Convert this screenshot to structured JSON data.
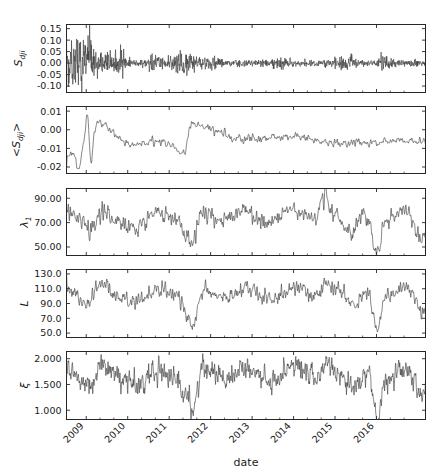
{
  "figure": {
    "width": 443,
    "height": 472,
    "background": "#ffffff",
    "line_color": "#3c3c3c",
    "axis_color": "#262626",
    "xlabel": "date"
  },
  "chart_data": {
    "type": "line",
    "title": "",
    "xlabel": "date",
    "ylabel": "",
    "grid": false,
    "legend": null,
    "layout": "5 stacked panels sharing a common time axis",
    "x_axis": {
      "type": "date",
      "tick_labels": [
        "2009",
        "2010",
        "2011",
        "2012",
        "2013",
        "2014",
        "2015",
        "2016"
      ],
      "tick_rotation_deg": -45,
      "range_start": "2008-07",
      "range_end": "2016-10",
      "minor_ticks_per_major": 2
    },
    "panels": [
      {
        "id": "panel-sdji",
        "ylabel": "S_dji",
        "ylabel_display": "S",
        "ylabel_sub": "dji",
        "ytick_labels": [
          "0.15",
          "0.10",
          "0.05",
          "0.00",
          "-0.05",
          "-0.10"
        ],
        "ytick_values": [
          0.15,
          0.1,
          0.05,
          0.0,
          -0.05,
          -0.1
        ],
        "ylim": [
          -0.128,
          0.168
        ],
        "description": "Daily DJIA index returns. High volatility cluster late 2008 to mid 2009 with spikes to +0.105 and -0.095, smaller bursts at 2010 flash crash, 2011 European debt crisis, and 2015 correction. Baseline noise amplitude about 0.008.",
        "series": [
          {
            "name": "S_dji",
            "seed": 11,
            "baseline": 0.0,
            "base_amp": 0.0075,
            "volatility_events": [
              {
                "x": 0.005,
                "width": 0.085,
                "amp": 0.055
              },
              {
                "x": 0.055,
                "width": 0.05,
                "amp": 0.032
              },
              {
                "x": 0.135,
                "width": 0.045,
                "amp": 0.02
              },
              {
                "x": 0.245,
                "width": 0.035,
                "amp": 0.016
              },
              {
                "x": 0.325,
                "width": 0.045,
                "amp": 0.02
              },
              {
                "x": 0.4,
                "width": 0.03,
                "amp": 0.012
              },
              {
                "x": 0.6,
                "width": 0.03,
                "amp": 0.009
              },
              {
                "x": 0.78,
                "width": 0.035,
                "amp": 0.014
              },
              {
                "x": 0.885,
                "width": 0.025,
                "amp": 0.011
              }
            ],
            "spikes": [
              {
                "x": 0.028,
                "y": 0.105
              },
              {
                "x": 0.033,
                "y": -0.095
              },
              {
                "x": 0.02,
                "y": 0.062
              },
              {
                "x": 0.041,
                "y": -0.078
              },
              {
                "x": 0.062,
                "y": 0.052
              },
              {
                "x": 0.072,
                "y": -0.04
              },
              {
                "x": 0.248,
                "y": 0.035
              },
              {
                "x": 0.335,
                "y": -0.055
              },
              {
                "x": 0.345,
                "y": 0.04
              },
              {
                "x": 0.795,
                "y": 0.038
              }
            ]
          }
        ]
      },
      {
        "id": "panel-mean-sdji",
        "ylabel": "<S_dji>",
        "ylabel_display": "<S",
        "ylabel_sub": "dji",
        "ylabel_tail": ">",
        "ytick_labels": [
          "0.01",
          "0.00",
          "-0.01",
          "-0.02"
        ],
        "ytick_values": [
          0.01,
          0.0,
          -0.01,
          -0.02
        ],
        "ylim": [
          -0.0235,
          0.0125
        ],
        "description": "Windowed mean of DJIA returns. Deep negative excursions to -0.021 in late 2008 / early 2009, recovery after, mild oscillation around zero with dips near -0.009 in 2010, -0.012 in 2011, -0.007 in 2015 and 2016.",
        "series": [
          {
            "name": "<S_dji>",
            "seed": 29,
            "baseline": 0.0005,
            "base_amp": 0.0022,
            "smooth": 3,
            "events": [
              {
                "x": 0.02,
                "y": -0.0135
              },
              {
                "x": 0.035,
                "y": -0.0205
              },
              {
                "x": 0.048,
                "y": -0.0065
              },
              {
                "x": 0.058,
                "y": 0.0098
              },
              {
                "x": 0.068,
                "y": -0.0185
              },
              {
                "x": 0.082,
                "y": 0.0042
              },
              {
                "x": 0.18,
                "y": -0.0075
              },
              {
                "x": 0.255,
                "y": -0.0062
              },
              {
                "x": 0.33,
                "y": -0.0118
              },
              {
                "x": 0.345,
                "y": 0.0035
              },
              {
                "x": 0.5,
                "y": -0.0048
              },
              {
                "x": 0.64,
                "y": -0.004
              },
              {
                "x": 0.76,
                "y": -0.0068
              },
              {
                "x": 0.86,
                "y": -0.0072
              },
              {
                "x": 0.905,
                "y": -0.0062
              }
            ]
          }
        ]
      },
      {
        "id": "panel-lambda1",
        "ylabel": "lambda_1",
        "ylabel_display": "λ",
        "ylabel_sub": "1",
        "ytick_labels": [
          "90.00",
          "70.00",
          "50.00"
        ],
        "ytick_values": [
          90,
          70,
          50
        ],
        "ylim": [
          43,
          98
        ],
        "description": "Largest eigenvalue of the correlation matrix. Oscillates around 72 with range roughly 55 to 92. Sharp drops to about 52 in late 2011 and about 48 in early 2016, peak near 93 in mid 2014.",
        "series": [
          {
            "name": "lambda_1",
            "seed": 47,
            "baseline": 72,
            "base_amp": 6.5,
            "smooth": 2,
            "events": [
              {
                "x": 0.015,
                "y": 78
              },
              {
                "x": 0.06,
                "y": 64
              },
              {
                "x": 0.105,
                "y": 80
              },
              {
                "x": 0.15,
                "y": 70
              },
              {
                "x": 0.19,
                "y": 65
              },
              {
                "x": 0.25,
                "y": 79
              },
              {
                "x": 0.3,
                "y": 74
              },
              {
                "x": 0.34,
                "y": 57
              },
              {
                "x": 0.352,
                "y": 52
              },
              {
                "x": 0.375,
                "y": 78
              },
              {
                "x": 0.43,
                "y": 72
              },
              {
                "x": 0.49,
                "y": 80
              },
              {
                "x": 0.56,
                "y": 70
              },
              {
                "x": 0.63,
                "y": 81
              },
              {
                "x": 0.69,
                "y": 73
              },
              {
                "x": 0.72,
                "y": 92
              },
              {
                "x": 0.745,
                "y": 78
              },
              {
                "x": 0.79,
                "y": 63
              },
              {
                "x": 0.83,
                "y": 76
              },
              {
                "x": 0.868,
                "y": 48
              },
              {
                "x": 0.885,
                "y": 72
              },
              {
                "x": 0.94,
                "y": 80
              },
              {
                "x": 0.985,
                "y": 60
              }
            ]
          }
        ]
      },
      {
        "id": "panel-L",
        "ylabel": "L",
        "ylabel_display": "L",
        "ytick_labels": [
          "130.0",
          "110.0",
          "90.0",
          "70.0",
          "50.0"
        ],
        "ytick_values": [
          130,
          110,
          90,
          70,
          50
        ],
        "ylim": [
          44,
          136
        ],
        "description": "Network measure L. Fluctuates around 100 within 80 to 120. Deep troughs to about 58 in late 2011 and about 55 in early 2016, peaks near 122 in 2009 and 2014.",
        "series": [
          {
            "name": "L",
            "seed": 63,
            "baseline": 100,
            "base_amp": 10,
            "smooth": 2,
            "events": [
              {
                "x": 0.012,
                "y": 104
              },
              {
                "x": 0.055,
                "y": 88
              },
              {
                "x": 0.1,
                "y": 118
              },
              {
                "x": 0.15,
                "y": 98
              },
              {
                "x": 0.2,
                "y": 92
              },
              {
                "x": 0.255,
                "y": 108
              },
              {
                "x": 0.305,
                "y": 100
              },
              {
                "x": 0.34,
                "y": 72
              },
              {
                "x": 0.352,
                "y": 58
              },
              {
                "x": 0.38,
                "y": 108
              },
              {
                "x": 0.44,
                "y": 98
              },
              {
                "x": 0.5,
                "y": 110
              },
              {
                "x": 0.57,
                "y": 96
              },
              {
                "x": 0.64,
                "y": 112
              },
              {
                "x": 0.7,
                "y": 100
              },
              {
                "x": 0.725,
                "y": 120
              },
              {
                "x": 0.76,
                "y": 104
              },
              {
                "x": 0.8,
                "y": 86
              },
              {
                "x": 0.84,
                "y": 104
              },
              {
                "x": 0.868,
                "y": 55
              },
              {
                "x": 0.888,
                "y": 98
              },
              {
                "x": 0.945,
                "y": 112
              },
              {
                "x": 0.99,
                "y": 80
              }
            ]
          }
        ]
      },
      {
        "id": "panel-xi",
        "ylabel": "xi",
        "ylabel_display": "ξ",
        "ytick_labels": [
          "2.000",
          "1.500",
          "1.000"
        ],
        "ytick_values": [
          2.0,
          1.5,
          1.0
        ],
        "ylim": [
          0.82,
          2.14
        ],
        "description": "Correlation length xi. Noisy band centred near 1.6 spanning roughly 1.25 to 2.0. Drops to about 0.95 in late 2011 and about 0.88 in early 2016, highest sustained values near 1.95 during 2013 and 2014.",
        "series": [
          {
            "name": "xi",
            "seed": 81,
            "baseline": 1.62,
            "base_amp": 0.17,
            "smooth": 1,
            "events": [
              {
                "x": 0.015,
                "y": 1.7
              },
              {
                "x": 0.055,
                "y": 1.45
              },
              {
                "x": 0.1,
                "y": 1.85
              },
              {
                "x": 0.15,
                "y": 1.62
              },
              {
                "x": 0.2,
                "y": 1.5
              },
              {
                "x": 0.255,
                "y": 1.75
              },
              {
                "x": 0.3,
                "y": 1.6
              },
              {
                "x": 0.34,
                "y": 1.25
              },
              {
                "x": 0.352,
                "y": 0.95
              },
              {
                "x": 0.38,
                "y": 1.8
              },
              {
                "x": 0.44,
                "y": 1.62
              },
              {
                "x": 0.5,
                "y": 1.82
              },
              {
                "x": 0.57,
                "y": 1.6
              },
              {
                "x": 0.64,
                "y": 1.88
              },
              {
                "x": 0.7,
                "y": 1.66
              },
              {
                "x": 0.725,
                "y": 1.95
              },
              {
                "x": 0.76,
                "y": 1.72
              },
              {
                "x": 0.8,
                "y": 1.42
              },
              {
                "x": 0.84,
                "y": 1.7
              },
              {
                "x": 0.868,
                "y": 0.88
              },
              {
                "x": 0.888,
                "y": 1.58
              },
              {
                "x": 0.945,
                "y": 1.84
              },
              {
                "x": 0.99,
                "y": 1.3
              }
            ]
          }
        ]
      }
    ]
  }
}
